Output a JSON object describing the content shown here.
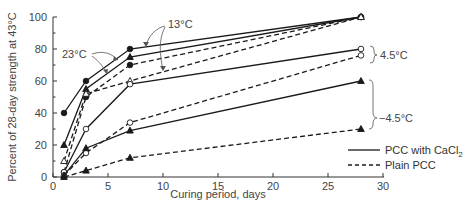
{
  "chart_data": {
    "type": "line",
    "title": "",
    "xlabel": "Curing period, days",
    "ylabel": "Percent of 28-day strength at 43°C",
    "xlim": [
      0,
      30
    ],
    "ylim": [
      0,
      100
    ],
    "x_ticks": [
      0,
      5,
      10,
      15,
      20,
      25,
      30
    ],
    "y_ticks": [
      0,
      20,
      40,
      60,
      80,
      100
    ],
    "grid": false,
    "x": [
      1,
      3,
      7,
      28
    ],
    "series": [
      {
        "name": "23°C PCC with CaCl2",
        "group": "23°C",
        "style": "solid",
        "marker": "filled-circle",
        "values": [
          40,
          60,
          80,
          100
        ]
      },
      {
        "name": "23°C Plain PCC",
        "group": "23°C",
        "style": "dashed",
        "marker": "filled-circle",
        "values": [
          3,
          50,
          70,
          100
        ]
      },
      {
        "name": "13°C PCC with CaCl2",
        "group": "13°C",
        "style": "solid",
        "marker": "filled-triangle",
        "values": [
          20,
          55,
          75,
          100
        ]
      },
      {
        "name": "13°C Plain PCC",
        "group": "13°C",
        "style": "dashed",
        "marker": "open-triangle",
        "values": [
          10,
          52,
          60,
          100
        ]
      },
      {
        "name": "4.5°C PCC with CaCl2",
        "group": "4.5°C",
        "style": "solid",
        "marker": "open-circle",
        "values": [
          3,
          30,
          58,
          80
        ]
      },
      {
        "name": "4.5°C Plain PCC",
        "group": "4.5°C",
        "style": "dashed",
        "marker": "open-circle",
        "values": [
          1,
          15,
          34,
          76
        ]
      },
      {
        "name": "-4.5°C PCC with CaCl2",
        "group": "-4.5°C",
        "style": "solid",
        "marker": "filled-triangle",
        "values": [
          1,
          18,
          29,
          60
        ]
      },
      {
        "name": "-4.5°C Plain PCC",
        "group": "-4.5°C",
        "style": "dashed",
        "marker": "filled-triangle",
        "values": [
          0,
          4,
          12,
          30
        ]
      }
    ],
    "annotations": [
      "23°C",
      "13°C",
      "4.5°C",
      "−4.5°C"
    ],
    "legend": {
      "position": "lower-right",
      "entries": [
        {
          "label": "PCC with CaCl",
          "subscript": "2",
          "style": "solid"
        },
        {
          "label": "Plain PCC",
          "style": "dashed"
        }
      ]
    }
  },
  "labels": {
    "xlabel": "Curing period, days",
    "ylabel": "Percent of 28-day strength at 43°C",
    "ann_23": "23°C",
    "ann_13": "13°C",
    "ann_45": "4.5°C",
    "ann_m45": "−4.5°C",
    "legend_solid": "PCC with CaCl",
    "legend_solid_sub": "2",
    "legend_dashed": "Plain PCC"
  },
  "colors": {
    "line": "#1a1a1a",
    "axis": "#333333",
    "text": "#444444",
    "arrow": "#555555"
  }
}
